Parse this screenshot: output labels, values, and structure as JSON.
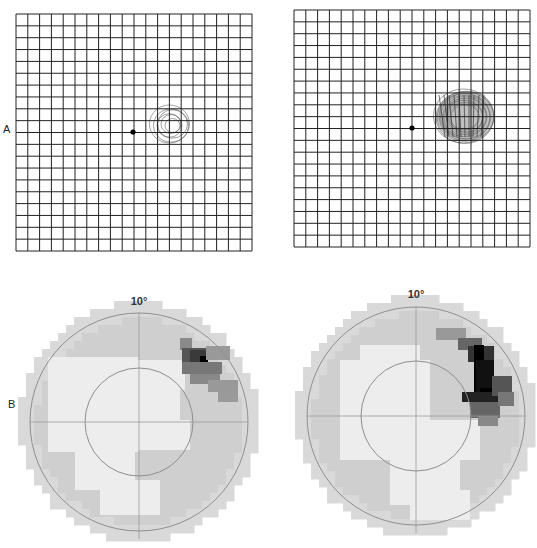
{
  "labels": {
    "row_a": "A",
    "row_b": "B"
  },
  "amsler_grids": [
    {
      "name": "left",
      "x": 16,
      "y": 14,
      "w": 236,
      "h": 237,
      "cells": 20,
      "fixation": [
        133,
        132
      ],
      "scotoma": {
        "cx": 171,
        "cy": 124,
        "rx": 20,
        "ry": 19,
        "density": "light"
      }
    },
    {
      "name": "right",
      "x": 294,
      "y": 10,
      "w": 236,
      "h": 237,
      "cells": 20,
      "fixation": [
        412,
        128
      ],
      "scotoma": {
        "cx": 465,
        "cy": 116,
        "rx": 30,
        "ry": 27,
        "density": "heavy"
      }
    }
  ],
  "field_maps": [
    {
      "name": "left",
      "cx": 139,
      "cy": 422,
      "outer_r": 109,
      "inner_r": 54,
      "label": "10°",
      "label_x": 139,
      "label_y": 305,
      "dark_cells": [
        [
          180,
          338,
          12,
          12,
          "#8a8a8a"
        ],
        [
          182,
          348,
          26,
          14,
          "#555"
        ],
        [
          190,
          350,
          16,
          22,
          "#3a3a3a"
        ],
        [
          200,
          356,
          8,
          8,
          "#000"
        ],
        [
          182,
          362,
          40,
          12,
          "#777"
        ],
        [
          190,
          374,
          30,
          10,
          "#888"
        ],
        [
          208,
          380,
          30,
          12,
          "#999"
        ],
        [
          218,
          392,
          20,
          10,
          "#9a9a9a"
        ],
        [
          206,
          346,
          24,
          14,
          "#999"
        ]
      ],
      "white_cells": [
        [
          48,
          357,
          90,
          95
        ],
        [
          85,
          360,
          100,
          30
        ],
        [
          120,
          380,
          60,
          60
        ],
        [
          75,
          450,
          60,
          40
        ],
        [
          100,
          480,
          60,
          35
        ],
        [
          120,
          420,
          70,
          30
        ]
      ]
    },
    {
      "name": "right",
      "cx": 416,
      "cy": 416,
      "outer_r": 109,
      "inner_r": 55,
      "label": "10°",
      "label_x": 416,
      "label_y": 298,
      "dark_cells": [
        [
          436,
          328,
          30,
          12,
          "#999"
        ],
        [
          458,
          338,
          24,
          12,
          "#666"
        ],
        [
          468,
          346,
          26,
          16,
          "#333"
        ],
        [
          474,
          345,
          10,
          50,
          "#000"
        ],
        [
          476,
          360,
          18,
          40,
          "#111"
        ],
        [
          480,
          388,
          18,
          20,
          "#000"
        ],
        [
          462,
          392,
          38,
          10,
          "#222"
        ],
        [
          470,
          402,
          30,
          16,
          "#666"
        ],
        [
          478,
          416,
          20,
          10,
          "#888"
        ],
        [
          492,
          376,
          20,
          20,
          "#555"
        ],
        [
          498,
          392,
          16,
          14,
          "#777"
        ]
      ],
      "white_cells": [
        [
          360,
          345,
          60,
          20
        ],
        [
          340,
          360,
          90,
          100
        ],
        [
          390,
          460,
          70,
          45
        ],
        [
          410,
          490,
          60,
          30
        ],
        [
          420,
          420,
          60,
          40
        ]
      ]
    }
  ]
}
